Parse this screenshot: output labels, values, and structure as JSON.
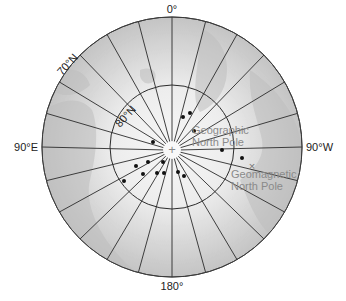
{
  "map": {
    "title": "",
    "projection": "north polar azimuthal",
    "center": [
      172,
      147
    ],
    "outer_radius": 130,
    "lat80_radius": 62,
    "meridian_step_deg": 15,
    "colors": {
      "ocean_outer": "#c9c9c9",
      "ocean_inner": "#f4f4f4",
      "land": "#b8b8b8",
      "grid": "#2b2b2b",
      "label": "#222222",
      "pole_label": "#8a8a8a",
      "dot": "#111111"
    },
    "labels": {
      "top": "0°",
      "bottom": "180°",
      "left": "90°E",
      "right": "90°W",
      "lat70": "70°N",
      "lat80": "80°N",
      "geographic_pole_line1": "Geographic",
      "geographic_pole_line2": "North Pole",
      "geomagnetic_pole_line1": "Geomagnetic",
      "geomagnetic_pole_line2": "North Pole"
    },
    "markers": {
      "geographic_pole_symbol": "+",
      "geomagnetic_pole_symbol": "×",
      "geographic_pole_xy": [
        172,
        150
      ],
      "geomagnetic_pole_xy": [
        252,
        166
      ]
    },
    "dots": [
      [
        183,
        117
      ],
      [
        190,
        113
      ],
      [
        194,
        131
      ],
      [
        222,
        150
      ],
      [
        242,
        158
      ],
      [
        153,
        142
      ],
      [
        148,
        162
      ],
      [
        136,
        166
      ],
      [
        143,
        174
      ],
      [
        164,
        173
      ],
      [
        157,
        173
      ],
      [
        178,
        172
      ],
      [
        184,
        176
      ],
      [
        124,
        181
      ],
      [
        163,
        162
      ]
    ]
  }
}
